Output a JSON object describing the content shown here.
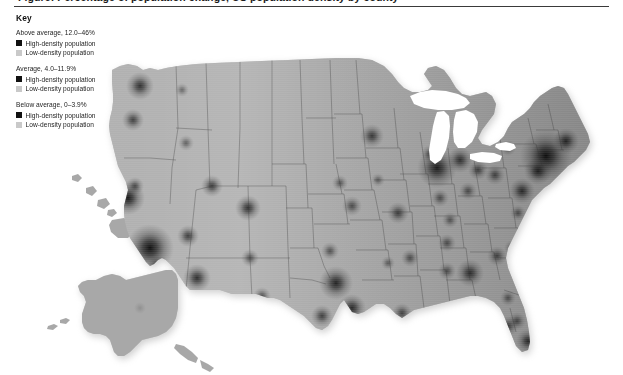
{
  "figure": {
    "title": "Figure: Percentage of population change, US population density by county",
    "title_visible_fragment": ""
  },
  "legend": {
    "heading": "Key",
    "groups": [
      {
        "label": "Above average, 12.0–46%",
        "rows": [
          {
            "label": "High-density population",
            "swatch_color": "#111111",
            "swatch_name": "swatch-high-density-above-average"
          },
          {
            "label": "Low-density population",
            "swatch_color": "#c9c9c9",
            "swatch_name": "swatch-low-density-above-average"
          }
        ]
      },
      {
        "label": "Average, 4.0–11.9%",
        "rows": [
          {
            "label": "High-density population",
            "swatch_color": "#111111",
            "swatch_name": "swatch-high-density-average"
          },
          {
            "label": "Low-density population",
            "swatch_color": "#c9c9c9",
            "swatch_name": "swatch-low-density-average"
          }
        ]
      },
      {
        "label": "Below average, 0–3.9%",
        "rows": [
          {
            "label": "High-density population",
            "swatch_color": "#111111",
            "swatch_name": "swatch-high-density-below-average"
          },
          {
            "label": "Low-density population",
            "swatch_color": "#c9c9c9",
            "swatch_name": "swatch-low-density-below-average"
          }
        ]
      }
    ]
  },
  "colors": {
    "background": "#ffffff",
    "land_base": "#a8a8a8",
    "state_border": "#6b6b6b",
    "water": "#ffffff",
    "hotspot_dark": "#0a0a0a",
    "title_rule": "#3a3a3a",
    "text": "#1d1d1d"
  },
  "chart_data": {
    "type": "heatmap",
    "title": "US population density by county",
    "xlabel": "",
    "ylabel": "",
    "projection": "albers-usa",
    "legend_position": "top-left",
    "grid": false,
    "value_label": "Population density (persons per sq mile)",
    "scale": {
      "min_label": "Low-density population",
      "max_label": "High-density population",
      "min_color": "#c9c9c9",
      "max_color": "#111111"
    },
    "classes": [
      {
        "name": "Above average",
        "range": [
          12.0,
          46.0
        ],
        "units": "%"
      },
      {
        "name": "Average",
        "range": [
          4.0,
          11.9
        ],
        "units": "%"
      },
      {
        "name": "Below average",
        "range": [
          0.0,
          3.9
        ],
        "units": "%"
      }
    ],
    "insets": [
      "Alaska",
      "Hawaii"
    ],
    "hotspots": [
      {
        "name": "New York",
        "x": 546,
        "y": 148,
        "r": 26,
        "intensity": 1.0
      },
      {
        "name": "Los Angeles",
        "x": 150,
        "y": 240,
        "r": 24,
        "intensity": 1.0
      },
      {
        "name": "Chicago",
        "x": 437,
        "y": 160,
        "r": 20,
        "intensity": 0.92
      },
      {
        "name": "San Francisco Bay",
        "x": 128,
        "y": 190,
        "r": 17,
        "intensity": 0.95
      },
      {
        "name": "Philadelphia",
        "x": 538,
        "y": 163,
        "r": 14,
        "intensity": 0.85
      },
      {
        "name": "Washington DC",
        "x": 522,
        "y": 183,
        "r": 13,
        "intensity": 0.82
      },
      {
        "name": "Boston",
        "x": 566,
        "y": 133,
        "r": 13,
        "intensity": 0.85
      },
      {
        "name": "Detroit",
        "x": 460,
        "y": 152,
        "r": 13,
        "intensity": 0.78
      },
      {
        "name": "Dallas-Fort Worth",
        "x": 336,
        "y": 275,
        "r": 17,
        "intensity": 0.88
      },
      {
        "name": "Houston",
        "x": 352,
        "y": 300,
        "r": 14,
        "intensity": 0.84
      },
      {
        "name": "Miami",
        "x": 528,
        "y": 333,
        "r": 12,
        "intensity": 0.82
      },
      {
        "name": "Atlanta",
        "x": 470,
        "y": 265,
        "r": 14,
        "intensity": 0.8
      },
      {
        "name": "Phoenix",
        "x": 197,
        "y": 270,
        "r": 14,
        "intensity": 0.82
      },
      {
        "name": "Seattle",
        "x": 140,
        "y": 78,
        "r": 14,
        "intensity": 0.8
      },
      {
        "name": "Denver",
        "x": 248,
        "y": 200,
        "r": 13,
        "intensity": 0.8
      },
      {
        "name": "Minneapolis",
        "x": 372,
        "y": 128,
        "r": 12,
        "intensity": 0.74
      },
      {
        "name": "St. Louis",
        "x": 398,
        "y": 205,
        "r": 11,
        "intensity": 0.7
      },
      {
        "name": "Las Vegas",
        "x": 188,
        "y": 228,
        "r": 11,
        "intensity": 0.72
      },
      {
        "name": "Portland",
        "x": 133,
        "y": 112,
        "r": 11,
        "intensity": 0.7
      },
      {
        "name": "Salt Lake City",
        "x": 212,
        "y": 178,
        "r": 11,
        "intensity": 0.72
      },
      {
        "name": "San Diego",
        "x": 158,
        "y": 258,
        "r": 11,
        "intensity": 0.78
      },
      {
        "name": "Tampa",
        "x": 508,
        "y": 318,
        "r": 10,
        "intensity": 0.7
      },
      {
        "name": "Charlotte",
        "x": 497,
        "y": 248,
        "r": 10,
        "intensity": 0.66
      },
      {
        "name": "Pittsburgh",
        "x": 495,
        "y": 167,
        "r": 10,
        "intensity": 0.66
      },
      {
        "name": "Cleveland",
        "x": 478,
        "y": 162,
        "r": 10,
        "intensity": 0.68
      },
      {
        "name": "Kansas City",
        "x": 352,
        "y": 198,
        "r": 10,
        "intensity": 0.62
      },
      {
        "name": "New Orleans",
        "x": 402,
        "y": 305,
        "r": 10,
        "intensity": 0.66
      },
      {
        "name": "San Antonio",
        "x": 322,
        "y": 308,
        "r": 11,
        "intensity": 0.7
      },
      {
        "name": "Nashville",
        "x": 447,
        "y": 235,
        "r": 9,
        "intensity": 0.6
      },
      {
        "name": "Indianapolis",
        "x": 440,
        "y": 190,
        "r": 9,
        "intensity": 0.6
      },
      {
        "name": "Columbus",
        "x": 468,
        "y": 183,
        "r": 9,
        "intensity": 0.6
      },
      {
        "name": "Memphis",
        "x": 410,
        "y": 250,
        "r": 9,
        "intensity": 0.6
      },
      {
        "name": "Milwaukee",
        "x": 430,
        "y": 146,
        "r": 9,
        "intensity": 0.6
      },
      {
        "name": "Oklahoma City",
        "x": 330,
        "y": 243,
        "r": 9,
        "intensity": 0.58
      },
      {
        "name": "Sacramento",
        "x": 135,
        "y": 178,
        "r": 9,
        "intensity": 0.62
      },
      {
        "name": "Orlando",
        "x": 517,
        "y": 313,
        "r": 9,
        "intensity": 0.62
      },
      {
        "name": "Birmingham",
        "x": 447,
        "y": 263,
        "r": 9,
        "intensity": 0.58
      },
      {
        "name": "Richmond",
        "x": 518,
        "y": 205,
        "r": 8,
        "intensity": 0.58
      },
      {
        "name": "Albuquerque",
        "x": 250,
        "y": 250,
        "r": 9,
        "intensity": 0.58
      },
      {
        "name": "Boise",
        "x": 186,
        "y": 135,
        "r": 8,
        "intensity": 0.5
      },
      {
        "name": "Omaha",
        "x": 340,
        "y": 175,
        "r": 8,
        "intensity": 0.54
      },
      {
        "name": "Louisville",
        "x": 450,
        "y": 212,
        "r": 8,
        "intensity": 0.55
      },
      {
        "name": "Buffalo",
        "x": 508,
        "y": 140,
        "r": 8,
        "intensity": 0.55
      },
      {
        "name": "Jacksonville",
        "x": 508,
        "y": 290,
        "r": 8,
        "intensity": 0.56
      },
      {
        "name": "Raleigh",
        "x": 512,
        "y": 240,
        "r": 8,
        "intensity": 0.56
      },
      {
        "name": "El Paso",
        "x": 262,
        "y": 288,
        "r": 9,
        "intensity": 0.6
      },
      {
        "name": "Spokane",
        "x": 182,
        "y": 82,
        "r": 7,
        "intensity": 0.45
      },
      {
        "name": "Tucson",
        "x": 208,
        "y": 290,
        "r": 8,
        "intensity": 0.55
      },
      {
        "name": "Des Moines",
        "x": 378,
        "y": 172,
        "r": 7,
        "intensity": 0.48
      },
      {
        "name": "Little Rock",
        "x": 388,
        "y": 255,
        "r": 7,
        "intensity": 0.5
      },
      {
        "name": "Anchorage",
        "x": 140,
        "y": 300,
        "r": 6,
        "intensity": 0.35
      },
      {
        "name": "Honolulu",
        "x": 113,
        "y": 208,
        "r": 5,
        "intensity": 0.4
      }
    ]
  }
}
